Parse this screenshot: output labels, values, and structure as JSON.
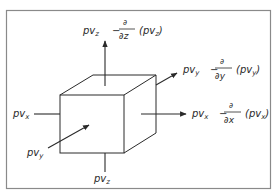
{
  "diagram": {
    "colors": {
      "line": "#2a2a2a",
      "frame": "#8a8a8a",
      "background": "#ffffff"
    },
    "inflows": {
      "x": {
        "base": "pv",
        "sub": "x"
      },
      "y": {
        "base": "pv",
        "sub": "y"
      },
      "z": {
        "base": "pv",
        "sub": "z"
      }
    },
    "outflows": {
      "z": {
        "base": "pv",
        "sub": "z",
        "minus": "−",
        "partial": "∂",
        "wrt": "∂z",
        "paren_base": "(pv",
        "paren_sub": "z",
        "paren_close": ")"
      },
      "y": {
        "base": "pv",
        "sub": "y",
        "minus": "−",
        "partial": "∂",
        "wrt": "∂y",
        "paren_base": "(pv",
        "paren_sub": "y",
        "paren_close": ")"
      },
      "x": {
        "base": "pv",
        "sub": "x",
        "minus": "−",
        "partial": "∂",
        "wrt": "∂x",
        "paren_base": "(pv",
        "paren_sub": "x",
        "paren_close": ")"
      }
    }
  }
}
